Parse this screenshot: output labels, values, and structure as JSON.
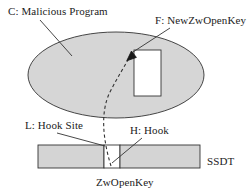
{
  "diagram": {
    "title_present": false,
    "labels": {
      "malicious_program": "C: Malicious Program",
      "new_function": "F: NewZwOpenKey",
      "hook_site": "L: Hook Site",
      "hook": "H: Hook",
      "table": "SSDT",
      "entry": "ZwOpenKey"
    },
    "shapes": {
      "ellipse_name": "malicious-program-ellipse",
      "rect_name": "new-zwopenkey-rectangle",
      "bar_name": "ssdt-bar",
      "gap_name": "ssdt-hooked-entry-gap"
    },
    "colors": {
      "fill_gray": "#d4d4d4",
      "stroke": "#333333",
      "white": "#ffffff",
      "text": "#222222"
    },
    "connectors": {
      "hook_arrow_style": "dashed-curve-with-arrowhead",
      "leader_style": "solid-thin-line"
    }
  }
}
